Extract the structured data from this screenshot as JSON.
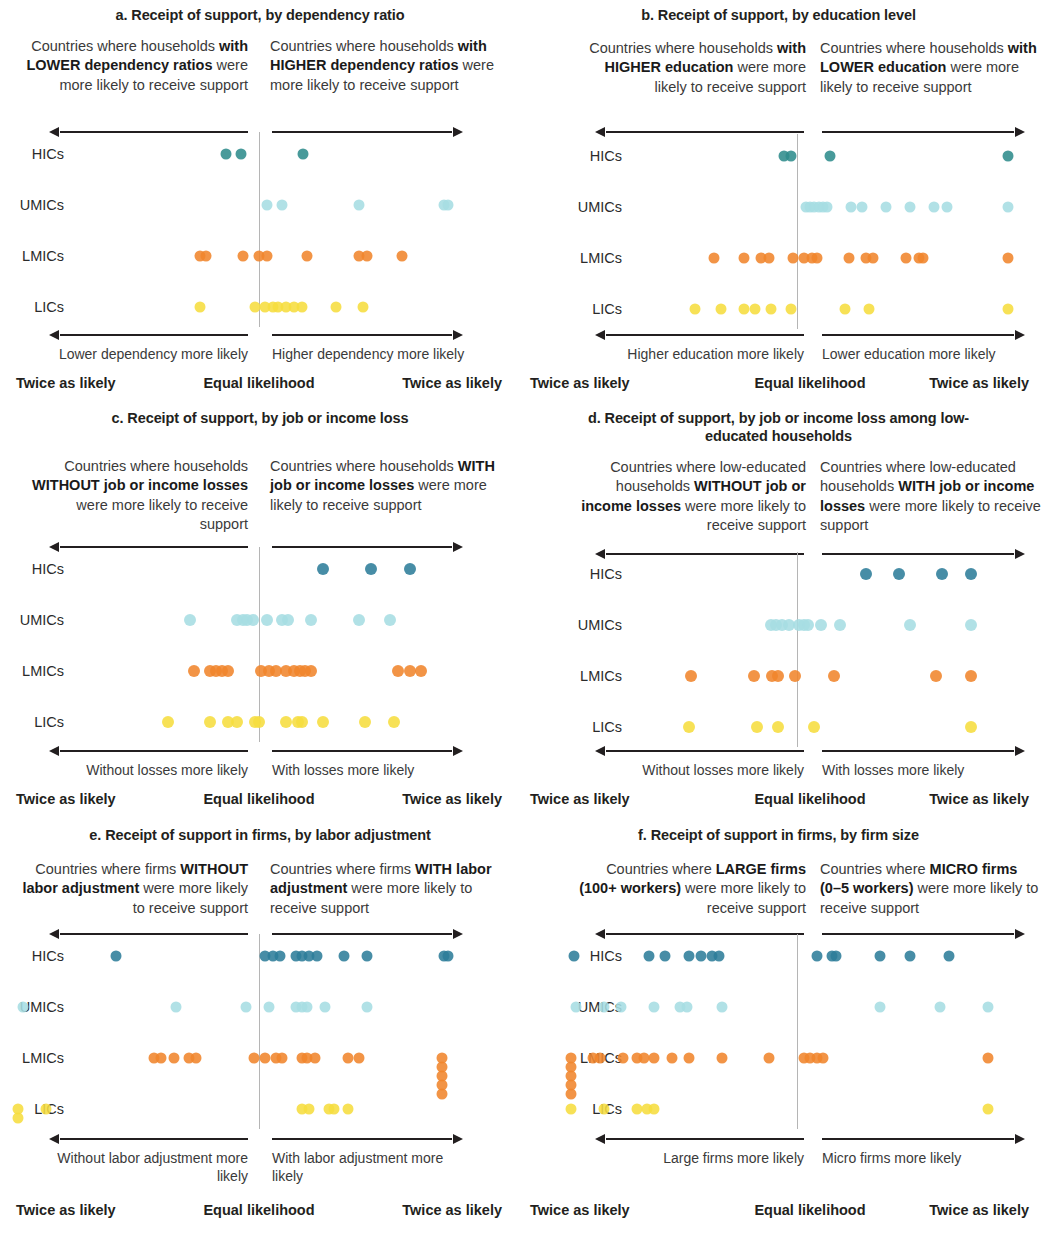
{
  "figure": {
    "series_colors": {
      "HICs_ab": "#2f8c8c",
      "HICs_cdef": "#2d7d9a",
      "UMICs": "#a6dde2",
      "LMICs": "#f0852c",
      "LICs": "#f6dd3f"
    },
    "row_labels": [
      "HICs",
      "UMICs",
      "LMICs",
      "LICs"
    ],
    "scale_labels": {
      "left": "Twice as likely",
      "center": "Equal likelihood",
      "right": "Twice as likely"
    }
  },
  "chart_data": [
    {
      "id": "a",
      "type": "scatter",
      "title": "a. Receipt of support, by dependency ratio",
      "header_left_html": "Countries where households <b>with LOWER dependency ratios</b> were more likely to receive support",
      "header_right_html": "Countries where households <b>with HIGHER dependency ratios</b> were more likely to receive support",
      "footnote_left": "Lower dependency more likely",
      "footnote_right": "Higher dependency more likely",
      "xlabel": "",
      "ylabel": "",
      "xlim": [
        -1,
        1
      ],
      "xtick_labels": [
        "Twice as likely",
        "Equal likelihood",
        "Twice as likely"
      ],
      "grid": false,
      "legend": "none",
      "note": "x is log-ratio position: -1 = twice as likely (left), 0 = equal, +1 = twice as likely (right)",
      "series": [
        {
          "name": "HICs",
          "color": "#2f8c8c",
          "values": [
            -0.17,
            -0.09,
            0.23
          ]
        },
        {
          "name": "UMICs",
          "color": "#a6dde2",
          "values": [
            0.04,
            0.12,
            0.52,
            0.96,
            0.98
          ]
        },
        {
          "name": "LMICs",
          "color": "#f0852c",
          "values": [
            -0.3,
            -0.27,
            -0.08,
            0.0,
            0.04,
            0.25,
            0.52,
            0.56,
            0.74
          ]
        },
        {
          "name": "LICs",
          "color": "#f6dd3f",
          "values": [
            -0.3,
            -0.02,
            0.03,
            0.07,
            0.1,
            0.14,
            0.18,
            0.22,
            0.4,
            0.54
          ]
        }
      ]
    },
    {
      "id": "b",
      "type": "scatter",
      "title": "b. Receipt of support, by education level",
      "header_left_html": "Countries where households <b>with HIGHER education</b> were more likely to receive support",
      "header_right_html": "Countries where households <b>with LOWER education</b> were more likely to receive support",
      "footnote_left": "Higher education more likely",
      "footnote_right": "Lower education more likely",
      "xlabel": "",
      "ylabel": "",
      "xlim": [
        -1,
        1
      ],
      "xtick_labels": [
        "Twice as likely",
        "Equal likelihood",
        "Twice as likely"
      ],
      "grid": false,
      "legend": "none",
      "series": [
        {
          "name": "HICs",
          "color": "#2f8c8c",
          "values": [
            -0.07,
            -0.03,
            0.15,
            0.97
          ]
        },
        {
          "name": "UMICs",
          "color": "#a6dde2",
          "values": [
            0.04,
            0.06,
            0.08,
            0.1,
            0.12,
            0.14,
            0.25,
            0.3,
            0.41,
            0.52,
            0.63,
            0.69,
            0.97
          ]
        },
        {
          "name": "LMICs",
          "color": "#f0852c",
          "values": [
            -0.44,
            -0.28,
            -0.19,
            -0.15,
            -0.02,
            0.03,
            0.07,
            0.09,
            0.24,
            0.32,
            0.35,
            0.5,
            0.56,
            0.58,
            0.97
          ]
        },
        {
          "name": "LICs",
          "color": "#f6dd3f",
          "values": [
            -0.54,
            -0.4,
            -0.28,
            -0.22,
            -0.14,
            -0.03,
            0.22,
            0.33,
            0.97
          ]
        }
      ]
    },
    {
      "id": "c",
      "type": "scatter",
      "title": "c. Receipt of support, by job or income loss",
      "header_left_html": "Countries where households <b>WITHOUT job or income losses</b> were more likely to receive support",
      "header_right_html": "Countries where households <b>WITH job or income losses</b> were more likely to receive support",
      "footnote_left": "Without losses more likely",
      "footnote_right": "With losses more likely",
      "xlabel": "",
      "ylabel": "",
      "xlim": [
        -1,
        1
      ],
      "xtick_labels": [
        "Twice as likely",
        "Equal likelihood",
        "Twice as likely"
      ],
      "grid": false,
      "legend": "none",
      "series": [
        {
          "name": "HICs",
          "color": "#2d7d9a",
          "values": [
            0.33,
            0.58,
            0.78
          ]
        },
        {
          "name": "UMICs",
          "color": "#a6dde2",
          "values": [
            -0.35,
            -0.11,
            -0.08,
            -0.06,
            -0.03,
            0.04,
            0.12,
            0.15,
            0.27,
            0.52,
            0.68
          ]
        },
        {
          "name": "LMICs",
          "color": "#f0852c",
          "values": [
            -0.33,
            -0.25,
            -0.22,
            -0.19,
            -0.16,
            0.01,
            0.05,
            0.09,
            0.14,
            0.18,
            0.21,
            0.24,
            0.27,
            0.72,
            0.78,
            0.84
          ]
        },
        {
          "name": "LICs",
          "color": "#f6dd3f",
          "values": [
            -0.46,
            -0.25,
            -0.16,
            -0.11,
            -0.02,
            0.0,
            0.14,
            0.2,
            0.22,
            0.33,
            0.55,
            0.7
          ]
        }
      ]
    },
    {
      "id": "d",
      "type": "scatter",
      "title": "d. Receipt of support, by job or income loss among low-educated households",
      "header_left_html": "Countries where low-educated households <b>WITHOUT job or income losses</b> were more likely to receive support",
      "header_right_html": "Countries where low-educated households <b>WITH job or income losses</b> were more likely to receive support",
      "footnote_left": "Without losses more likely",
      "footnote_right": "With losses more likely",
      "xlabel": "",
      "ylabel": "",
      "xlim": [
        -1,
        1
      ],
      "xtick_labels": [
        "Twice as likely",
        "Equal likelihood",
        "Twice as likely"
      ],
      "grid": false,
      "legend": "none",
      "series": [
        {
          "name": "HICs",
          "color": "#2d7d9a",
          "values": [
            0.32,
            0.47,
            0.67,
            0.8
          ]
        },
        {
          "name": "UMICs",
          "color": "#a6dde2",
          "values": [
            -0.14,
            -0.11,
            -0.08,
            -0.04,
            0.01,
            0.03,
            0.05,
            0.11,
            0.2,
            0.52,
            0.8
          ]
        },
        {
          "name": "LMICs",
          "color": "#f0852c",
          "values": [
            -0.56,
            -0.23,
            -0.13,
            -0.1,
            -0.01,
            0.17,
            0.64,
            0.8
          ]
        },
        {
          "name": "LICs",
          "color": "#f6dd3f",
          "values": [
            -0.57,
            -0.21,
            -0.1,
            0.08,
            0.8
          ]
        }
      ]
    },
    {
      "id": "e",
      "type": "scatter",
      "title": "e. Receipt of support in firms, by labor adjustment",
      "header_left_html": "Countries where firms <b>WITHOUT labor adjustment</b> were more likely to receive support",
      "header_right_html": "Countries where firms <b>WITH labor adjustment</b> were more likely to receive support",
      "footnote_left": "Without labor adjustment more likely",
      "footnote_right": "With labor adjustment more likely",
      "xlabel": "",
      "ylabel": "",
      "xlim": [
        -1,
        1
      ],
      "xtick_labels": [
        "Twice as likely",
        "Equal likelihood",
        "Twice as likely"
      ],
      "grid": false,
      "legend": "none",
      "series": [
        {
          "name": "HICs",
          "color": "#2d7d9a",
          "values": [
            -0.57,
            0.03,
            0.07,
            0.11,
            0.19,
            0.22,
            0.26,
            0.3,
            0.44,
            0.56,
            0.96,
            0.98
          ]
        },
        {
          "name": "UMICs",
          "color": "#a6dde2",
          "values": [
            -0.94,
            -0.33,
            -0.05,
            0.05,
            0.19,
            0.22,
            0.25,
            0.34,
            0.56
          ]
        },
        {
          "name": "LMICs",
          "color": "#f0852c",
          "values": [
            -0.42,
            -0.39,
            -0.34,
            -0.28,
            -0.25,
            -0.02,
            0.03,
            0.09,
            0.12,
            0.22,
            0.25,
            0.29,
            0.46,
            0.52,
            0.95,
            0.95,
            0.95,
            0.95,
            0.95
          ]
        },
        {
          "name": "LICs",
          "color": "#f6dd3f",
          "values": [
            -0.96,
            -0.96,
            -0.85,
            0.22,
            0.26,
            0.36,
            0.39,
            0.46
          ]
        }
      ]
    },
    {
      "id": "f",
      "type": "scatter",
      "title": "f. Receipt of support in firms, by firm size",
      "header_left_html": "Countries where <b>LARGE firms (100+ workers)</b> were more likely to receive support",
      "header_right_html": "Countries where <b>MICRO firms (0–5 workers)</b> were more likely to receive support",
      "footnote_left": "Large firms more likely",
      "footnote_right": "Micro firms more likely",
      "xlabel": "",
      "ylabel": "",
      "xlim": [
        -1,
        1
      ],
      "xtick_labels": [
        "Twice as likely",
        "Equal likelihood",
        "Twice as likely"
      ],
      "grid": false,
      "legend": "none",
      "series": [
        {
          "name": "HICs",
          "color": "#2d7d9a",
          "values": [
            -0.95,
            -0.63,
            -0.56,
            -0.46,
            -0.41,
            -0.36,
            -0.33,
            0.09,
            0.16,
            0.18,
            0.38,
            0.52,
            0.7
          ]
        },
        {
          "name": "UMICs",
          "color": "#a6dde2",
          "values": [
            -0.94,
            -0.82,
            -0.75,
            -0.61,
            -0.5,
            -0.47,
            -0.32,
            0.38,
            0.66,
            0.88
          ]
        },
        {
          "name": "LMICs",
          "color": "#f0852c",
          "values": [
            -0.96,
            -0.96,
            -0.96,
            -0.96,
            -0.96,
            -0.87,
            -0.84,
            -0.74,
            -0.68,
            -0.65,
            -0.61,
            -0.53,
            -0.46,
            -0.32,
            -0.12,
            0.03,
            0.06,
            0.09,
            0.12,
            0.88
          ]
        },
        {
          "name": "LICs",
          "color": "#f6dd3f",
          "values": [
            -0.96,
            -0.82,
            -0.68,
            -0.64,
            -0.61,
            0.88
          ]
        }
      ]
    }
  ]
}
